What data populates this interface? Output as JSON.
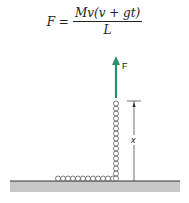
{
  "equation": {
    "lhs": "F =",
    "numerator": "Mv(v + gt)",
    "denominator": "L"
  },
  "labels": {
    "force": "F",
    "height": "x"
  },
  "colors": {
    "arrow": "#2e8b6e",
    "floor": "#c8c8c8",
    "line": "#333333"
  }
}
